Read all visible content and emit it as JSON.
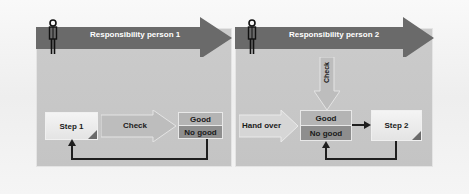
{
  "diagram": {
    "colors": {
      "banner": "#6a6a6a",
      "panel": "#c6c6c6",
      "good": "#b4b4b4",
      "no_good": "#8e8e8e",
      "step_box": "#ececec",
      "connector": "#1e1e1e"
    },
    "lanes": [
      {
        "banner_label": "Responsibility person 1",
        "icon": "person-icon",
        "step": {
          "label": "Step 1"
        },
        "transition": {
          "label": "Check",
          "direction": "right"
        },
        "decision": {
          "good_label": "Good",
          "no_good_label": "No good"
        },
        "feedback": "No good returns to Step 1"
      },
      {
        "banner_label": "Responsibility person 2",
        "icon": "person-icon",
        "incoming": {
          "label": "Hand over",
          "direction": "right"
        },
        "check_arrow": {
          "label": "Check",
          "direction": "down"
        },
        "decision": {
          "good_label": "Good",
          "no_good_label": "No good"
        },
        "step": {
          "label": "Step 2"
        },
        "feedback": "Step 2 returns to decision"
      }
    ]
  }
}
